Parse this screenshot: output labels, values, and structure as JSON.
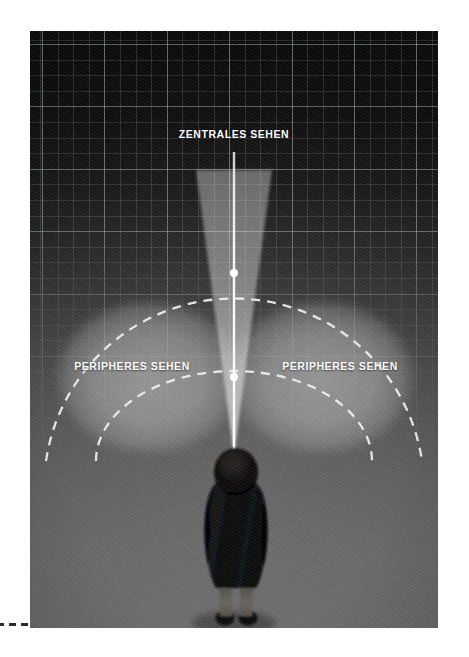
{
  "figure": {
    "name": "zentrales-und-peripheres-sehen-diagramm",
    "panel": {
      "x": 30,
      "y": 31,
      "width": 408,
      "height": 597,
      "background_top_color": "#0c0c0c",
      "background_bottom_color": "#6e6e6e"
    }
  },
  "labels": {
    "central_vision": "ZENTRALES SEHEN",
    "peripheral_vision_left": "PERIPHERES SEHEN",
    "peripheral_vision_right": "PERIPHERES SEHEN"
  },
  "colors": {
    "label_text": "#ffffff",
    "cone_fill": "#c9c9c9",
    "cone_center_line": "#ffffff",
    "peripheral_fill": "#b4b4b4",
    "dashed_arc": "#f2f2f2",
    "grid_line": "#c8cdcd",
    "person_body": "#0a0a0a",
    "registration_mark": "#2b2b2b"
  },
  "diagram": {
    "viewer": {
      "name": "person-standing-top-down",
      "eye_point_x": 204,
      "eye_point_y": 424
    },
    "central_cone": {
      "name": "central-vision-cone",
      "apex_x": 204,
      "apex_y": 424,
      "top_y": 139,
      "top_half_width": 36,
      "fill_opacity": 0.42
    },
    "center_axis": {
      "name": "gaze-axis-line",
      "x": 204,
      "from_y": 121,
      "to_y": 430,
      "width": 2.4
    },
    "gaze_markers": [
      {
        "name": "gaze-marker-far",
        "x": 204,
        "y": 242,
        "radius": 4.2
      },
      {
        "name": "gaze-marker-near",
        "x": 204,
        "y": 346,
        "radius": 4.2
      }
    ],
    "peripheral_fields": [
      {
        "name": "peripheral-field-left",
        "cx": 119,
        "cy": 346,
        "rx": 96,
        "ry": 80,
        "fill_opacity": 0.34
      },
      {
        "name": "peripheral-field-right",
        "cx": 291,
        "cy": 346,
        "rx": 96,
        "ry": 80,
        "fill_opacity": 0.34
      }
    ],
    "dashed_arcs": [
      {
        "name": "dashed-arc-outer",
        "cx": 204,
        "cy": 430,
        "rx": 190,
        "ry": 190,
        "dash": "8 7",
        "stroke_width": 2.3
      },
      {
        "name": "dashed-arc-inner",
        "cx": 204,
        "cy": 430,
        "rx": 138,
        "ry": 90,
        "dash": "8 7",
        "stroke_width": 2.3
      }
    ],
    "grid": {
      "name": "perspective-grid",
      "minor_spacing": 15.6,
      "major_spacing": 62.4,
      "visible": true
    }
  },
  "registration_marks": {
    "name": "print-registration-dashes",
    "count": 3
  }
}
